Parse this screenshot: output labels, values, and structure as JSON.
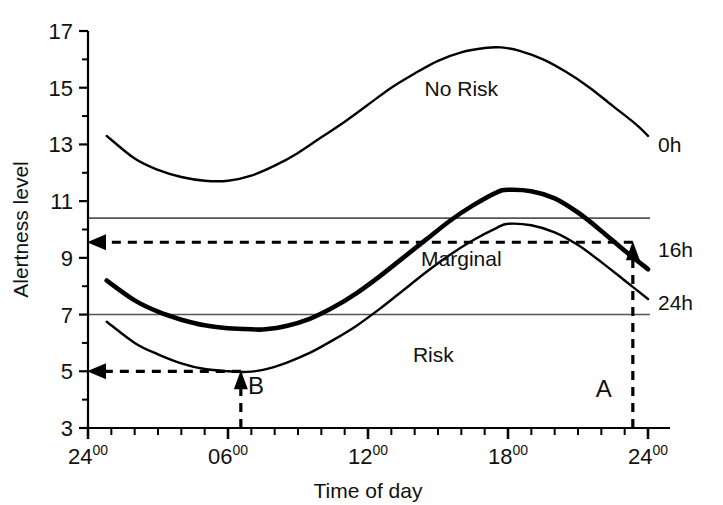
{
  "chart_data": {
    "type": "line",
    "title": "",
    "xlabel": "Time of day",
    "ylabel": "Alertness level",
    "ylim": [
      3,
      17
    ],
    "xlim": [
      24,
      48
    ],
    "grid": false,
    "legend_position": "right-edge-labels",
    "ytick_labels": [
      "3",
      "5",
      "7",
      "9",
      "11",
      "13",
      "15",
      "17"
    ],
    "ytick_values": [
      3,
      5,
      7,
      9,
      11,
      13,
      15,
      17
    ],
    "y_minor_values": [
      4,
      6,
      8,
      10,
      12,
      14,
      16
    ],
    "xtick_labels": [
      {
        "num": "24",
        "sup": "00"
      },
      {
        "num": "06",
        "sup": "00"
      },
      {
        "num": "12",
        "sup": "00"
      },
      {
        "num": "18",
        "sup": "00"
      },
      {
        "num": "24",
        "sup": "00"
      }
    ],
    "xtick_values": [
      24,
      30,
      36,
      42,
      48
    ],
    "x_minor_step": 1,
    "series": [
      {
        "name": "0h",
        "label": "0h",
        "style": "thin",
        "x": [
          24.8,
          26,
          27,
          28,
          29,
          30,
          31,
          32,
          33,
          34,
          35,
          36,
          37,
          38,
          39,
          40,
          41,
          41.7,
          42.5,
          43.5,
          44.5,
          45.5,
          46.5,
          47.5,
          48.0
        ],
        "values": [
          13.3,
          12.5,
          12.1,
          11.85,
          11.72,
          11.72,
          11.9,
          12.25,
          12.7,
          13.25,
          13.8,
          14.4,
          15.0,
          15.5,
          15.95,
          16.25,
          16.4,
          16.42,
          16.3,
          16.0,
          15.55,
          15.0,
          14.35,
          13.7,
          13.3
        ]
      },
      {
        "name": "16h",
        "label": "16h",
        "style": "bold",
        "x": [
          24.8,
          26,
          27,
          28,
          29,
          30,
          31,
          31.6,
          32.5,
          33.5,
          34.5,
          35.5,
          36.5,
          37.5,
          38.5,
          39.5,
          40.5,
          41.5,
          42.0,
          43,
          44,
          45,
          46,
          47,
          48.0
        ],
        "values": [
          8.2,
          7.5,
          7.1,
          6.82,
          6.62,
          6.52,
          6.48,
          6.48,
          6.6,
          6.85,
          7.25,
          7.75,
          8.35,
          9.0,
          9.65,
          10.3,
          10.85,
          11.3,
          11.4,
          11.35,
          11.1,
          10.6,
          9.95,
          9.25,
          8.6
        ]
      },
      {
        "name": "24h",
        "label": "24h",
        "style": "thin",
        "x": [
          24.8,
          26,
          27,
          28,
          29,
          30,
          30.8,
          31.5,
          32.5,
          33.5,
          34.5,
          35.5,
          36.5,
          37.5,
          38.5,
          39.5,
          40.5,
          41.5,
          42.0,
          43,
          44,
          45,
          46,
          47,
          48.0
        ],
        "values": [
          6.75,
          6.0,
          5.6,
          5.28,
          5.08,
          5.0,
          4.98,
          5.05,
          5.3,
          5.65,
          6.1,
          6.6,
          7.2,
          7.85,
          8.5,
          9.1,
          9.62,
          10.05,
          10.2,
          10.15,
          9.9,
          9.45,
          8.85,
          8.2,
          7.55
        ]
      }
    ],
    "reference_lines": [
      {
        "name": "upper-threshold",
        "y": 10.4
      },
      {
        "name": "lower-threshold",
        "y": 7.0
      }
    ],
    "annotations": [
      {
        "name": "A",
        "label": "A",
        "x": 47.35,
        "y_value": 9.55,
        "vertical_arrow": {
          "from_y": 3.0,
          "to_y": 9.55
        },
        "horizontal_arrow": {
          "from_x": 47.35,
          "to_x": 24.0,
          "y": 9.55
        },
        "label_x": 46.1,
        "label_y": 4.1
      },
      {
        "name": "B",
        "label": "B",
        "x": 30.55,
        "y_value": 5.0,
        "vertical_arrow": {
          "from_y": 3.0,
          "to_y": 5.0
        },
        "horizontal_arrow": {
          "from_x": 30.55,
          "to_x": 24.0,
          "y": 5.0
        },
        "label_x": 31.2,
        "label_y": 4.2
      }
    ],
    "region_labels": [
      {
        "name": "no-risk",
        "text": "No Risk",
        "x": 40.0,
        "y": 15.0
      },
      {
        "name": "marginal",
        "text": "Marginal",
        "x": 40.0,
        "y": 9.0
      },
      {
        "name": "risk",
        "text": "Risk",
        "x": 38.8,
        "y": 5.6
      }
    ],
    "colors": {
      "axis": "#000000",
      "curve": "#000000",
      "reference_line": "#555555",
      "annotation": "#000000",
      "background": "#ffffff"
    }
  }
}
